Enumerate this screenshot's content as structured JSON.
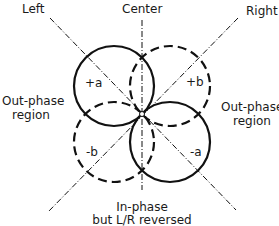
{
  "labels": {
    "left": "Left",
    "center": "Center",
    "right": "Right",
    "out_phase_left_1": "Out-phase",
    "out_phase_left_2": "region",
    "out_phase_right_1": "Out-phase",
    "out_phase_right_2": "region",
    "in_phase_1": "In-phase",
    "in_phase_2": "but L/R reversed"
  },
  "lobes": {
    "plus_a": "+a",
    "plus_b": "+b",
    "minus_a": "-a",
    "minus_b": "-b"
  },
  "colors": {
    "line": "#111111",
    "background": "#ffffff"
  }
}
